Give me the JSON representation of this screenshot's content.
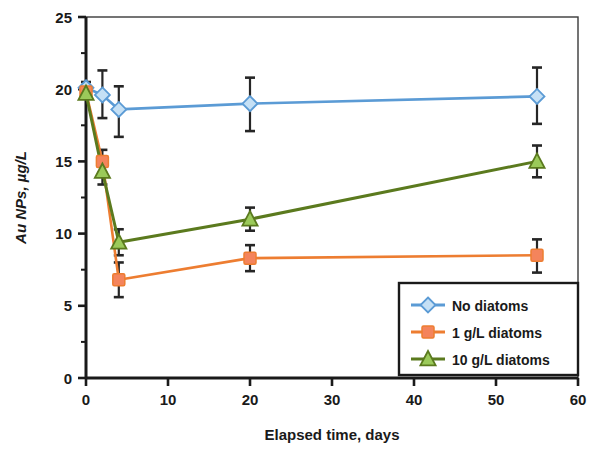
{
  "chart_data": {
    "type": "line",
    "title": "",
    "xlabel": "Elapsed time, days",
    "ylabel": "Au NPs, µg/L",
    "xlim": [
      0,
      60
    ],
    "ylim": [
      0,
      25
    ],
    "xticks": [
      0,
      10,
      20,
      30,
      40,
      50,
      60
    ],
    "yticks": [
      0,
      5,
      10,
      15,
      20,
      25
    ],
    "xtick_labels": [
      "0",
      "10",
      "20",
      "30",
      "40",
      "50",
      "60"
    ],
    "ytick_labels": [
      "0",
      "5",
      "10",
      "15",
      "20",
      "25"
    ],
    "yminor_ticks": [
      2.5,
      7.5,
      12.5,
      17.5,
      22.5
    ],
    "grid": false,
    "legend_position": "lower right",
    "series": [
      {
        "name": "No diatoms",
        "color": "#5B9BD5",
        "marker": "diamond",
        "marker_fill": "#C5E0F5",
        "x": [
          0,
          2,
          4,
          20,
          55
        ],
        "y": [
          20.1,
          19.6,
          18.6,
          19.0,
          19.5
        ],
        "yerr_low": [
          0.4,
          1.6,
          1.9,
          1.9,
          1.9
        ],
        "yerr_high": [
          0.4,
          1.7,
          1.6,
          1.8,
          2.0
        ]
      },
      {
        "name": "1 g/L diatoms",
        "color": "#ED7D31",
        "marker": "square",
        "marker_fill": "#F4845C",
        "x": [
          0,
          2,
          4,
          20,
          55
        ],
        "y": [
          19.8,
          15.0,
          6.8,
          8.3,
          8.5
        ],
        "yerr_low": [
          0.3,
          0.8,
          1.2,
          0.9,
          1.2
        ],
        "yerr_high": [
          0.3,
          0.8,
          1.2,
          0.9,
          1.1
        ]
      },
      {
        "name": "10 g/L diatoms",
        "color": "#5B7A1E",
        "marker": "triangle",
        "marker_fill": "#9BCA5A",
        "x": [
          0,
          2,
          4,
          20,
          55
        ],
        "y": [
          19.7,
          14.3,
          9.4,
          11.0,
          15.0
        ],
        "yerr_low": [
          0.3,
          0.9,
          0.9,
          0.8,
          1.1
        ],
        "yerr_high": [
          0.3,
          0.9,
          0.9,
          0.8,
          1.1
        ]
      }
    ]
  },
  "axis": {
    "x_title": "Elapsed time, days",
    "y_title": "Au NPs, µg/L"
  },
  "legend": {
    "items": [
      {
        "label": "No diatoms"
      },
      {
        "label": "1 g/L diatoms"
      },
      {
        "label": "10 g/L diatoms"
      }
    ]
  },
  "ticks": {
    "x": [
      "0",
      "10",
      "20",
      "30",
      "40",
      "50",
      "60"
    ],
    "y": [
      "0",
      "5",
      "10",
      "15",
      "20",
      "25"
    ]
  }
}
